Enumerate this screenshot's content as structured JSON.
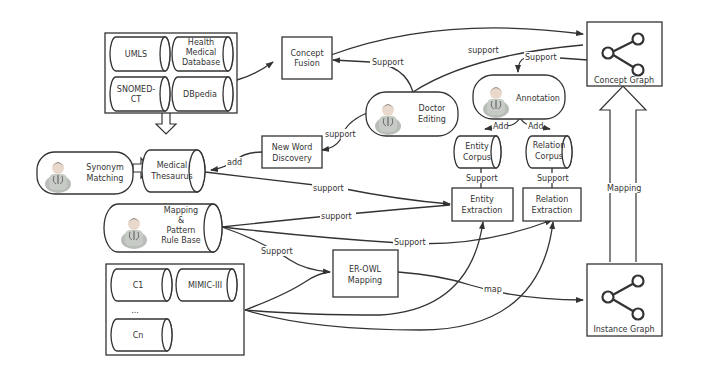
{
  "diagram": {
    "nodes": {
      "umls": "UMLS",
      "health_db": [
        "Health",
        "Medical",
        "Database"
      ],
      "snomed": [
        "SNOMED-",
        "CT"
      ],
      "dbpedia": "DBpedia",
      "concept_fusion": [
        "Concept",
        "Fusion"
      ],
      "doctor_editing": [
        "Doctor",
        "Editing"
      ],
      "annotation": "Annotation",
      "concept_graph": "Concept Graph",
      "synonym_matching": [
        "Synonym",
        "Matching"
      ],
      "medical_thesaurus": [
        "Medical",
        "Thesaurus"
      ],
      "new_word_discovery": [
        "New Word",
        "Discovery"
      ],
      "entity_corpus": [
        "Entity",
        "Corpus"
      ],
      "relation_corpus": [
        "Relation",
        "Corpus"
      ],
      "mapping_rule_base": [
        "Mapping",
        "&",
        "Pattern",
        "Rule Base"
      ],
      "entity_extraction": [
        "Entity",
        "Extraction"
      ],
      "relation_extraction": [
        "Relation",
        "Extraction"
      ],
      "er_owl_mapping": [
        "ER-OWL",
        "Mapping"
      ],
      "c1": "C1",
      "mimic": "MIMIC-III",
      "ellipsis": "...",
      "cn": "Cn",
      "instance_graph": "Instance Graph"
    },
    "edge_labels": {
      "fusion_support": "Support",
      "doctor_support_top": "support",
      "annotation_support": "Support",
      "doctor_support_newword": "support",
      "add_thesaurus": "add",
      "add_entity": "Add",
      "add_relation": "Add",
      "entity_corpus_support": "Support",
      "relation_corpus_support": "Support",
      "thesaurus_support": "support",
      "rulebase_support_entity": "support",
      "rulebase_support_relation": "Support",
      "rulebase_support_erowl": "Support",
      "map": "map",
      "mapping": "Mapping"
    }
  },
  "colors": {
    "stroke": "#333333",
    "background": "#ffffff",
    "avatar_body": "#b9bdb8",
    "avatar_hair": "#3a3a3a"
  }
}
